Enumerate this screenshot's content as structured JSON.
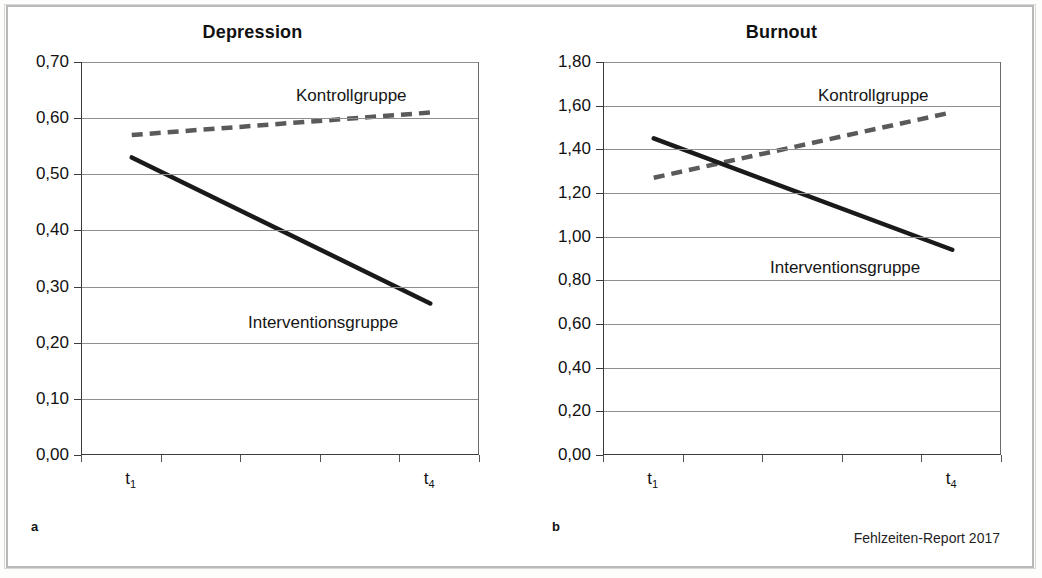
{
  "figure": {
    "source_note": "Fehlzeiten-Report 2017"
  },
  "panels": [
    {
      "letter": "a",
      "title": "Depression",
      "series_labels": {
        "control": "Kontrollgruppe",
        "intervention": "Interventionsgruppe"
      }
    },
    {
      "letter": "b",
      "title": "Burnout",
      "series_labels": {
        "control": "Kontrollgruppe",
        "intervention": "Interventionsgruppe"
      }
    }
  ],
  "chart_data": [
    {
      "type": "line",
      "title": "Depression",
      "panel": "a",
      "xlabel": "",
      "ylabel": "",
      "x": [
        "t1",
        "t4"
      ],
      "x_tick_labels": [
        "t₁",
        "t₄"
      ],
      "ylim": [
        0.0,
        0.7
      ],
      "ytick_labels": [
        "0,70",
        "0,60",
        "0,50",
        "0,40",
        "0,30",
        "0,20",
        "0,10",
        "0,00"
      ],
      "ytick_values": [
        0.7,
        0.6,
        0.5,
        0.4,
        0.3,
        0.2,
        0.1,
        0.0
      ],
      "grid": true,
      "legend": "inline-annotation",
      "series": [
        {
          "name": "Kontrollgruppe",
          "values": [
            0.57,
            0.61
          ],
          "style": "dashed",
          "color": "#5a5a5a"
        },
        {
          "name": "Interventionsgruppe",
          "values": [
            0.53,
            0.27
          ],
          "style": "solid",
          "color": "#1a1a1a"
        }
      ]
    },
    {
      "type": "line",
      "title": "Burnout",
      "panel": "b",
      "xlabel": "",
      "ylabel": "",
      "x": [
        "t1",
        "t4"
      ],
      "x_tick_labels": [
        "t₁",
        "t₄"
      ],
      "ylim": [
        0.0,
        1.8
      ],
      "ytick_labels": [
        "1,80",
        "1,60",
        "1,40",
        "1,20",
        "1,00",
        "0,80",
        "0,60",
        "0,40",
        "0,20",
        "0,00"
      ],
      "ytick_values": [
        1.8,
        1.6,
        1.4,
        1.2,
        1.0,
        0.8,
        0.6,
        0.4,
        0.2,
        0.0
      ],
      "grid": true,
      "legend": "inline-annotation",
      "series": [
        {
          "name": "Kontrollgruppe",
          "values": [
            1.27,
            1.57
          ],
          "style": "dashed",
          "color": "#5a5a5a"
        },
        {
          "name": "Interventionsgruppe",
          "values": [
            1.45,
            0.94
          ],
          "style": "solid",
          "color": "#1a1a1a"
        }
      ]
    }
  ]
}
